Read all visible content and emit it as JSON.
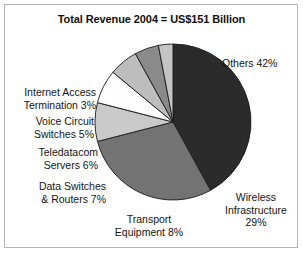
{
  "chart_data": {
    "type": "pie",
    "title": "Total Revenue 2004 = US$151 Billion",
    "subtitle": "",
    "xlabel": "",
    "ylabel": "",
    "units": "percent",
    "total_label": "US$151 Billion",
    "year": "2004",
    "legend_position": "callout-labels",
    "grid": false,
    "start_angle_deg": 0,
    "direction": "clockwise",
    "categories": [
      "Others",
      "Wireless Infrastructure",
      "Transport Equipment",
      "Data Switches & Routers",
      "Teledatacom Servers",
      "Voice Circuit Switches",
      "Internet Access Termination"
    ],
    "values": [
      42,
      29,
      8,
      7,
      6,
      5,
      3
    ],
    "colors": [
      "#2b2b2b",
      "#737373",
      "#c9c9c9",
      "#fdfdfd",
      "#bdbdbd",
      "#8a8a8a",
      "#c4c4c4"
    ],
    "slices": [
      {
        "name": "Others",
        "value": 42,
        "value_text": "42%",
        "label": "Others 42%",
        "label_lines": [
          "Others 42%"
        ],
        "color": "#2b2b2b"
      },
      {
        "name": "Wireless Infrastructure",
        "value": 29,
        "value_text": "29%",
        "label": "Wireless Infrastructure 29%",
        "label_lines": [
          "Wireless",
          "Infrastructure",
          "29%"
        ],
        "color": "#737373"
      },
      {
        "name": "Transport Equipment",
        "value": 8,
        "value_text": "8%",
        "label": "Transport Equipment 8%",
        "label_lines": [
          "Transport",
          "Equipment 8%"
        ],
        "color": "#c9c9c9"
      },
      {
        "name": "Data Switches & Routers",
        "value": 7,
        "value_text": "7%",
        "label": "Data Switches & Routers 7%",
        "label_lines": [
          "Data Switches",
          "& Routers 7%"
        ],
        "color": "#fdfdfd"
      },
      {
        "name": "Teledatacom Servers",
        "value": 6,
        "value_text": "6%",
        "label": "Teledatacom Servers 6%",
        "label_lines": [
          "Teledatacom",
          "Servers 6%"
        ],
        "color": "#bdbdbd"
      },
      {
        "name": "Voice Circuit Switches",
        "value": 5,
        "value_text": "5%",
        "label": "Voice Circuit Switches 5%",
        "label_lines": [
          "Voice Circuit",
          "Switches 5%"
        ],
        "color": "#8a8a8a"
      },
      {
        "name": "Internet Access Termination",
        "value": 3,
        "value_text": "3%",
        "label": "Internet Access Termination 3%",
        "label_lines": [
          "Internet Access",
          "Termination 3%"
        ],
        "color": "#c4c4c4"
      }
    ]
  },
  "figure": {
    "background": "#ffffff",
    "border_color": "#b4b4b4",
    "slice_outline_color": "#1a1a1a",
    "text_color": "#141414"
  },
  "labels": {
    "others_l1": "Others 42%",
    "wireless_l1": "Wireless",
    "wireless_l2": "Infrastructure",
    "wireless_l3": "29%",
    "transport_l1": "Transport",
    "transport_l2": "Equipment 8%",
    "data_switches_l1": "Data Switches",
    "data_switches_l2": "& Routers 7%",
    "teledatacom_l1": "Teledatacom",
    "teledatacom_l2": "Servers 6%",
    "voice_l1": "Voice Circuit",
    "voice_l2": "Switches 5%",
    "internet_l1": "Internet Access",
    "internet_l2": "Termination 3%"
  }
}
